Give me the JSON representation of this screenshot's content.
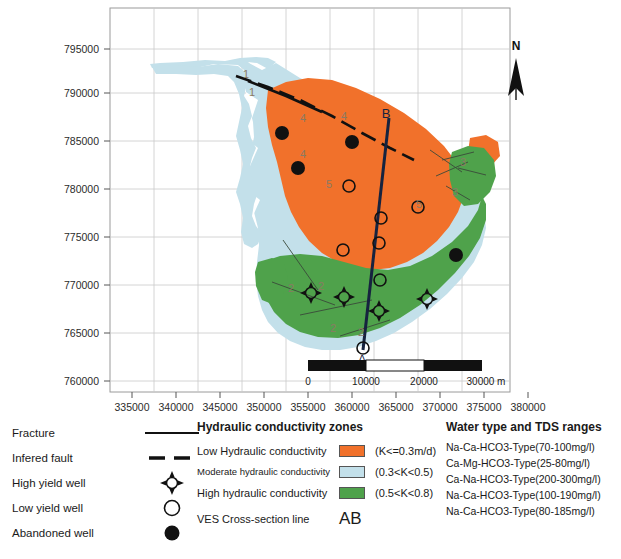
{
  "map": {
    "x_axis": {
      "ticks": [
        "335000",
        "340000",
        "345000",
        "350000",
        "355000",
        "360000",
        "365000",
        "370000",
        "375000",
        "380000"
      ],
      "min": 332500,
      "max": 382500
    },
    "y_axis": {
      "ticks": [
        "795000",
        "790000",
        "785000",
        "780000",
        "775000",
        "770000",
        "765000",
        "760000"
      ],
      "min": 757500,
      "max": 797500
    },
    "north_label": "N",
    "cross_section": {
      "start_label": "A",
      "end_label": "B"
    },
    "scale_bar": {
      "labels": [
        "0",
        "10000",
        "20000",
        "30000 m"
      ],
      "unit": "m"
    },
    "contour_labels": [
      "1",
      "1",
      "4",
      "4",
      "4",
      "5",
      "5",
      "2",
      "2",
      "2",
      "2",
      "3",
      "3"
    ]
  },
  "legend_symbols": {
    "items": [
      {
        "label": "Fracture",
        "glyph": "solid-line"
      },
      {
        "label": "Infered fault",
        "glyph": "dashed-line"
      },
      {
        "label": "High yield well",
        "glyph": "high-yield-well"
      },
      {
        "label": "Low yield well",
        "glyph": "open-circle"
      },
      {
        "label": "Abandoned well",
        "glyph": "filled-circle"
      }
    ]
  },
  "legend_hydraulic": {
    "title": "Hydraulic conductivity zones",
    "rows": [
      {
        "name": "Low Hydraulic conductivity",
        "range": "(K<=0.3m/d)",
        "color": "#F1712B"
      },
      {
        "name": "Moderate hydraulic conductivity",
        "range": "(0.3<K<0.5)",
        "color": "#C3E0EA"
      },
      {
        "name": "High hydraulic conductivity",
        "range": "(0.5<K<0.8)",
        "color": "#4FA24B"
      }
    ],
    "ves_label": "VES Cross-section line",
    "ves_glyph": "AB"
  },
  "legend_water": {
    "title": "Water type and TDS ranges",
    "rows": [
      "Na-Ca-HCO3-Type(70-100mg/l)",
      "Ca-Mg-HCO3-Type(25-80mg/l)",
      "Ca-Na-HCO3-Type(200-300mg/l)",
      "Na-Ca-HCO3-Type(100-190mg/l)",
      "Na-Ca-HCO3-Type(80-185mg/l)"
    ]
  },
  "colors": {
    "low_conductivity": "#F1712B",
    "moderate_conductivity": "#C3E0EA",
    "high_conductivity": "#4FA24B",
    "cross_section_line": "#16233F",
    "grid": "#c9c9c9",
    "frame": "#9a9a9a"
  }
}
